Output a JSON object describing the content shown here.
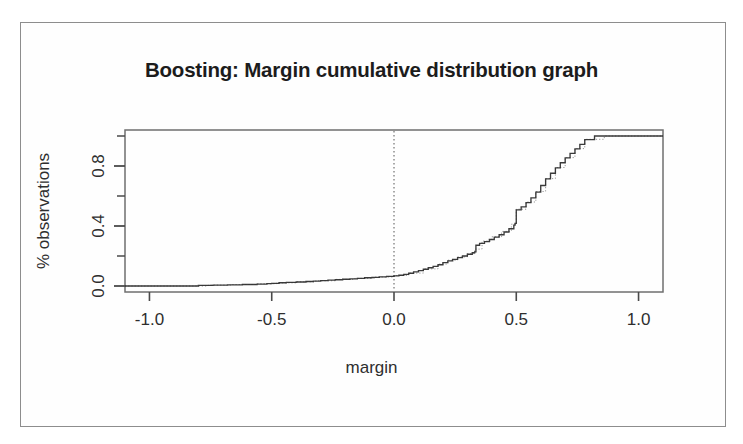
{
  "figure": {
    "title": "Boosting: Margin cumulative distribution graph",
    "border_color": "#8d8d8d",
    "background": "#fefefe"
  },
  "chart_data": {
    "type": "line",
    "title": "Boosting: Margin cumulative distribution graph",
    "subtitle": "",
    "xlabel": "margin",
    "ylabel": "% observations",
    "xlim": [
      -1.1,
      1.1
    ],
    "ylim": [
      -0.04,
      1.04
    ],
    "xticks": [
      -1.0,
      -0.5,
      0.0,
      0.5,
      1.0
    ],
    "xtick_labels": [
      "-1.0",
      "-0.5",
      "0.0",
      "0.5",
      "1.0"
    ],
    "yticks": [
      0.0,
      0.2,
      0.4,
      0.6,
      0.8,
      1.0
    ],
    "ytick_labels": [
      "0.0",
      "",
      "0.4",
      "",
      "0.8",
      ""
    ],
    "ytick_labeled": [
      0.0,
      0.4,
      0.8
    ],
    "grid": false,
    "legend": "none",
    "line_color": "#2f2f2f",
    "reference_line": {
      "orientation": "vertical",
      "x": 0.0,
      "style": "dotted",
      "color": "#555555"
    },
    "annotations": [],
    "series": [
      {
        "name": "margin ecdf",
        "style": "step",
        "x": [
          -1.1,
          -0.84,
          -0.8,
          -0.74,
          -0.68,
          -0.62,
          -0.56,
          -0.52,
          -0.5,
          -0.47,
          -0.44,
          -0.4,
          -0.36,
          -0.33,
          -0.3,
          -0.27,
          -0.24,
          -0.21,
          -0.18,
          -0.15,
          -0.12,
          -0.09,
          -0.06,
          -0.03,
          0.0,
          0.02,
          0.04,
          0.06,
          0.08,
          0.1,
          0.12,
          0.14,
          0.16,
          0.18,
          0.2,
          0.22,
          0.24,
          0.26,
          0.28,
          0.3,
          0.32,
          0.33,
          0.335,
          0.35,
          0.37,
          0.39,
          0.41,
          0.43,
          0.45,
          0.47,
          0.49,
          0.495,
          0.5,
          0.52,
          0.54,
          0.56,
          0.58,
          0.6,
          0.62,
          0.64,
          0.66,
          0.68,
          0.7,
          0.72,
          0.74,
          0.76,
          0.78,
          0.82,
          0.9,
          1.0,
          1.1
        ],
        "y": [
          0.0,
          0.0,
          0.004,
          0.006,
          0.008,
          0.01,
          0.013,
          0.016,
          0.018,
          0.022,
          0.024,
          0.027,
          0.03,
          0.033,
          0.036,
          0.039,
          0.042,
          0.045,
          0.048,
          0.051,
          0.055,
          0.058,
          0.061,
          0.064,
          0.068,
          0.072,
          0.078,
          0.085,
          0.094,
          0.103,
          0.112,
          0.122,
          0.131,
          0.142,
          0.156,
          0.168,
          0.178,
          0.189,
          0.2,
          0.212,
          0.222,
          0.228,
          0.272,
          0.284,
          0.296,
          0.31,
          0.326,
          0.342,
          0.36,
          0.382,
          0.406,
          0.418,
          0.508,
          0.528,
          0.556,
          0.588,
          0.626,
          0.67,
          0.714,
          0.752,
          0.788,
          0.822,
          0.854,
          0.884,
          0.914,
          0.944,
          0.976,
          1.0,
          1.0,
          1.0,
          1.0
        ]
      },
      {
        "name": "margin ecdf smooth overlay",
        "style": "dotted-step",
        "x": [
          -1.1,
          -0.84,
          -0.76,
          -0.66,
          -0.56,
          -0.48,
          -0.4,
          -0.32,
          -0.24,
          -0.16,
          -0.08,
          0.0,
          0.06,
          0.12,
          0.18,
          0.22,
          0.26,
          0.3,
          0.33,
          0.36,
          0.4,
          0.44,
          0.48,
          0.5,
          0.54,
          0.58,
          0.62,
          0.66,
          0.7,
          0.74,
          0.78,
          0.86,
          1.0,
          1.1
        ],
        "y": [
          0.0,
          0.0,
          0.006,
          0.01,
          0.015,
          0.021,
          0.028,
          0.035,
          0.044,
          0.051,
          0.06,
          0.07,
          0.086,
          0.114,
          0.146,
          0.172,
          0.194,
          0.216,
          0.246,
          0.3,
          0.328,
          0.364,
          0.412,
          0.512,
          0.56,
          0.63,
          0.716,
          0.79,
          0.856,
          0.916,
          0.978,
          1.0,
          1.0,
          1.0
        ]
      }
    ]
  },
  "axes": {
    "x_title": "margin",
    "y_title": "% observations"
  }
}
